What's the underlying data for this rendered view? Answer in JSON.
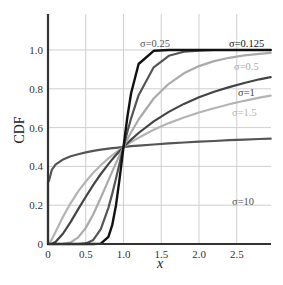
{
  "chart_data": {
    "type": "line",
    "title": "",
    "xlabel": "x",
    "ylabel": "CDF",
    "xlim": [
      0,
      2.95
    ],
    "ylim": [
      0,
      1.15
    ],
    "grid": true,
    "legend_position": "inline labels at right",
    "x_ticks": [
      "0",
      "0.5",
      "1.0",
      "1.5",
      "2.0",
      "2.5"
    ],
    "x_tick_values": [
      0,
      0.5,
      1.0,
      1.5,
      2.0,
      2.5
    ],
    "y_ticks": [
      "0",
      "0.2",
      "0.4",
      "0.6",
      "0.8",
      "1.0"
    ],
    "y_tick_values": [
      0,
      0.2,
      0.4,
      0.6,
      0.8,
      1.0
    ],
    "x": [
      0.01,
      0.05,
      0.1,
      0.2,
      0.3,
      0.4,
      0.5,
      0.6,
      0.7,
      0.8,
      0.85,
      0.9,
      0.95,
      1.0,
      1.05,
      1.1,
      1.2,
      1.4,
      1.6,
      1.8,
      2.0,
      2.2,
      2.4,
      2.6,
      2.8,
      2.95
    ],
    "series": [
      {
        "name": "σ=10",
        "label": "σ=10",
        "color": "#555555",
        "width": 2.2,
        "values": [
          0.323,
          0.382,
          0.409,
          0.436,
          0.452,
          0.463,
          0.472,
          0.48,
          0.486,
          0.491,
          0.494,
          0.496,
          0.498,
          0.5,
          0.502,
          0.504,
          0.507,
          0.513,
          0.519,
          0.523,
          0.528,
          0.531,
          0.535,
          0.538,
          0.541,
          0.543
        ],
        "label_pos": [
          232,
          205
        ]
      },
      {
        "name": "σ=1.5",
        "label": "σ=1.5",
        "color": "#b4b4b4",
        "width": 2.2,
        "values": [
          0.001,
          0.023,
          0.062,
          0.142,
          0.211,
          0.271,
          0.322,
          0.367,
          0.406,
          0.441,
          0.457,
          0.472,
          0.486,
          0.5,
          0.513,
          0.525,
          0.548,
          0.589,
          0.623,
          0.652,
          0.678,
          0.7,
          0.72,
          0.738,
          0.754,
          0.765
        ],
        "label_pos": [
          232,
          116
        ]
      },
      {
        "name": "σ=1",
        "label": "σ=1",
        "color": "#444444",
        "width": 2.2,
        "values": [
          0.0,
          0.001,
          0.011,
          0.054,
          0.114,
          0.18,
          0.244,
          0.305,
          0.361,
          0.412,
          0.436,
          0.458,
          0.48,
          0.5,
          0.519,
          0.538,
          0.572,
          0.632,
          0.681,
          0.722,
          0.756,
          0.785,
          0.809,
          0.83,
          0.849,
          0.86
        ],
        "label_pos": [
          238,
          96
        ]
      },
      {
        "name": "σ=0.5",
        "label": "σ=0.5",
        "color": "#aaaaaa",
        "width": 2.2,
        "values": [
          0.0,
          0.0,
          0.0,
          0.001,
          0.008,
          0.034,
          0.083,
          0.153,
          0.238,
          0.328,
          0.373,
          0.417,
          0.459,
          0.5,
          0.539,
          0.576,
          0.642,
          0.75,
          0.826,
          0.88,
          0.917,
          0.943,
          0.96,
          0.972,
          0.98,
          0.985
        ],
        "label_pos": [
          234,
          70
        ]
      },
      {
        "name": "σ=0.25",
        "label": "σ=0.25",
        "color": "#555555",
        "width": 2.2,
        "values": [
          0.0,
          0.0,
          0.0,
          0.0,
          0.0,
          0.0,
          0.003,
          0.021,
          0.077,
          0.186,
          0.258,
          0.337,
          0.419,
          0.5,
          0.577,
          0.648,
          0.767,
          0.911,
          0.97,
          0.991,
          0.997,
          1.0,
          1.0,
          1.0,
          1.0,
          1.0
        ],
        "label_pos": [
          140,
          47
        ]
      },
      {
        "name": "σ=0.125",
        "label": "σ=0.125",
        "color": "#111111",
        "width": 2.4,
        "values": [
          0.0,
          0.0,
          0.0,
          0.0,
          0.0,
          0.0,
          0.0,
          0.0,
          0.002,
          0.037,
          0.097,
          0.2,
          0.341,
          0.5,
          0.652,
          0.777,
          0.928,
          0.996,
          1.0,
          1.0,
          1.0,
          1.0,
          1.0,
          1.0,
          1.0,
          1.0
        ],
        "label_pos": [
          229,
          47
        ]
      }
    ]
  },
  "labels": {
    "xlabel": "x",
    "ylabel": "CDF"
  }
}
